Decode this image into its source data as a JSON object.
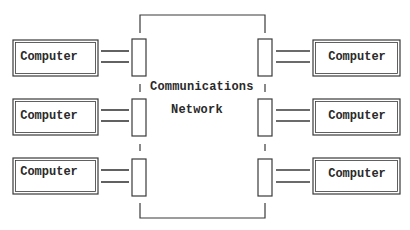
{
  "diagram": {
    "network": {
      "label_line1": "Communications",
      "label_line2": "Network"
    },
    "left_computers": [
      {
        "label": "Computer"
      },
      {
        "label": "Computer"
      },
      {
        "label": "Computer"
      }
    ],
    "right_computers": [
      {
        "label": "Computer"
      },
      {
        "label": "Computer"
      },
      {
        "label": "Computer"
      }
    ],
    "colors": {
      "stroke": "#3a3a3a",
      "background": "#ffffff"
    }
  }
}
